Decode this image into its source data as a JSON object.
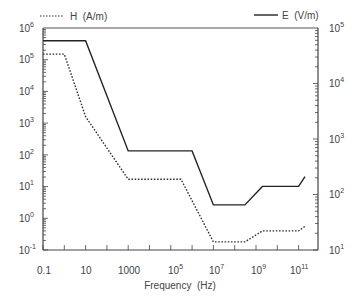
{
  "chart_data": {
    "type": "line",
    "title": "",
    "xlabel": "Frequency (Hz)",
    "ylabel_left": "H (A/m)",
    "ylabel_right": "E (V/m)",
    "x_scale": "log",
    "y_scale": "log",
    "xlim": [
      0.1,
      1000000000000.0
    ],
    "ylim_left": [
      0.1,
      1000000.0
    ],
    "ylim_right": [
      10,
      100000.0
    ],
    "x_tick_labels": [
      "0.1",
      "10",
      "1000",
      "10^5",
      "10^7",
      "10^9",
      "10^11"
    ],
    "y_left_tick_labels": [
      "10^-1",
      "10^0",
      "10^1",
      "10^2",
      "10^3",
      "10^4",
      "10^5",
      "10^6"
    ],
    "y_right_tick_labels": [
      "10^1",
      "10^2",
      "10^3",
      "10^4",
      "10^5"
    ],
    "legend": [
      {
        "label": "H  (A/m)",
        "style": "dotted",
        "position": "top-left"
      },
      {
        "label": "E  (V/m)",
        "style": "solid",
        "position": "top-right"
      }
    ],
    "grid": false,
    "series": [
      {
        "name": "H (A/m)",
        "axis": "left",
        "style": "dotted",
        "x": [
          0.1,
          1,
          10,
          1000,
          300000,
          10000000,
          300000000,
          2000000000,
          100000000000,
          200000000000
        ],
        "values": [
          150000,
          150000,
          1600,
          17,
          17,
          0.18,
          0.18,
          0.4,
          0.4,
          0.56
        ]
      },
      {
        "name": "E (V/m)",
        "axis": "right",
        "style": "solid",
        "x": [
          0.1,
          10,
          1000,
          1000000,
          10000000,
          300000000,
          2000000000,
          100000000000,
          200000000000
        ],
        "values": [
          59000,
          59000,
          610,
          610,
          65,
          65,
          140,
          140,
          210
        ]
      }
    ]
  },
  "legend": {
    "h_label": "H  (A/m)",
    "e_label": "E  (V/m)"
  },
  "axes": {
    "x_title": "Frequency  (Hz)",
    "x_ticks": [
      {
        "base": "0.1",
        "exp": ""
      },
      {
        "base": "10",
        "exp": ""
      },
      {
        "base": "1000",
        "exp": ""
      },
      {
        "base": "10",
        "exp": "5"
      },
      {
        "base": "10",
        "exp": "7"
      },
      {
        "base": "10",
        "exp": "9"
      },
      {
        "base": "10",
        "exp": "11"
      }
    ],
    "y_left_ticks": [
      {
        "base": "10",
        "exp": "6"
      },
      {
        "base": "10",
        "exp": "5"
      },
      {
        "base": "10",
        "exp": "4"
      },
      {
        "base": "10",
        "exp": "3"
      },
      {
        "base": "10",
        "exp": "2"
      },
      {
        "base": "10",
        "exp": "1"
      },
      {
        "base": "10",
        "exp": "0"
      },
      {
        "base": "10",
        "exp": "-1"
      }
    ],
    "y_right_ticks": [
      {
        "base": "10",
        "exp": "5"
      },
      {
        "base": "10",
        "exp": "4"
      },
      {
        "base": "10",
        "exp": "3"
      },
      {
        "base": "10",
        "exp": "2"
      },
      {
        "base": "10",
        "exp": "1"
      }
    ]
  },
  "colors": {
    "axis": "#444444",
    "e_line": "#222222",
    "h_line": "#333333"
  }
}
